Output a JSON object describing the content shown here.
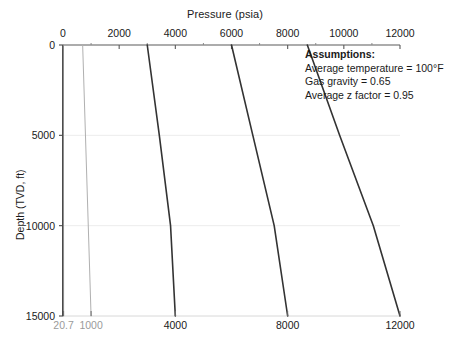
{
  "chart_data": {
    "type": "line",
    "title": "",
    "xlabel": "Pressure (psia)",
    "ylabel": "Depth (TVD, ft)",
    "xlim": [
      0,
      12000
    ],
    "ylim": [
      0,
      15000
    ],
    "y_inverted": true,
    "grid": true,
    "grid_axis": "y",
    "legend": "none",
    "x_axis_position": "top",
    "xticks_top": [
      0,
      2000,
      4000,
      6000,
      8000,
      10000,
      12000
    ],
    "xticks_top_labels": [
      "0",
      "2000",
      "4000",
      "6000",
      "8000",
      "10000",
      "12000"
    ],
    "xticks_top_minor": [
      1000,
      3000,
      5000,
      7000,
      9000,
      11000
    ],
    "xticks_bottom": [
      20.7,
      1000,
      4000,
      8000,
      12000
    ],
    "xticks_bottom_labels": [
      "20.7",
      "1000",
      "4000",
      "8000",
      "12000"
    ],
    "xticks_bottom_label_colors": [
      "#9a9a9a",
      "#9a9a9a",
      "#1a1a1a",
      "#1a1a1a",
      "#1a1a1a"
    ],
    "yticks": [
      0,
      5000,
      10000,
      15000
    ],
    "ytick_labels": [
      "0",
      "5000",
      "10000",
      "15000"
    ],
    "series": [
      {
        "name": "surface-pressure-14.7",
        "color": "#8f8f8f",
        "width": 1.0,
        "points": [
          [
            14.7,
            0
          ],
          [
            20.7,
            15000
          ]
        ]
      },
      {
        "name": "surface-pressure-700",
        "color": "#b0b0b0",
        "width": 1.0,
        "points": [
          [
            700,
            0
          ],
          [
            1000,
            15000
          ]
        ]
      },
      {
        "name": "surface-pressure-3000",
        "color": "#333333",
        "width": 1.6,
        "points": [
          [
            3000,
            0
          ],
          [
            3430,
            5000
          ],
          [
            3830,
            10000
          ],
          [
            4000,
            15000
          ]
        ]
      },
      {
        "name": "surface-pressure-6000",
        "color": "#333333",
        "width": 1.6,
        "points": [
          [
            6000,
            0
          ],
          [
            6760,
            5000
          ],
          [
            7520,
            10000
          ],
          [
            8000,
            15000
          ]
        ]
      },
      {
        "name": "surface-pressure-9000",
        "color": "#333333",
        "width": 1.6,
        "points": [
          [
            8700,
            0
          ],
          [
            9850,
            5000
          ],
          [
            11050,
            10000
          ],
          [
            12000,
            15000
          ]
        ]
      }
    ]
  },
  "annotation": {
    "title": "Assumptions:",
    "lines": [
      "Average temperature = 100°F",
      "Gas gravity = 0.65",
      "Average z factor = 0.95"
    ]
  }
}
